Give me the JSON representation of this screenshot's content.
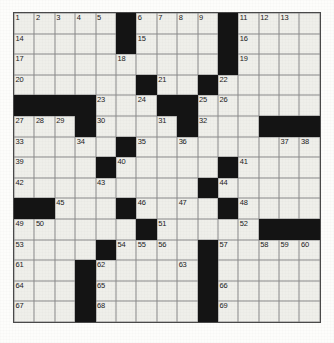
{
  "puzzle": {
    "type": "crossword-grid",
    "rows": 15,
    "cols": 15,
    "colors": {
      "block": "#141414",
      "open": "#efefea",
      "gridline": "#8a8a8a",
      "number": "#1a1a1a"
    },
    "blocks": [
      [
        0,
        5
      ],
      [
        0,
        10
      ],
      [
        1,
        5
      ],
      [
        1,
        10
      ],
      [
        2,
        10
      ],
      [
        3,
        6
      ],
      [
        3,
        9
      ],
      [
        4,
        0
      ],
      [
        4,
        1
      ],
      [
        4,
        2
      ],
      [
        4,
        3
      ],
      [
        4,
        7
      ],
      [
        4,
        8
      ],
      [
        5,
        3
      ],
      [
        5,
        8
      ],
      [
        5,
        12
      ],
      [
        5,
        13
      ],
      [
        5,
        14
      ],
      [
        6,
        5
      ],
      [
        7,
        4
      ],
      [
        7,
        10
      ],
      [
        8,
        9
      ],
      [
        9,
        0
      ],
      [
        9,
        1
      ],
      [
        9,
        5
      ],
      [
        9,
        10
      ],
      [
        10,
        6
      ],
      [
        10,
        12
      ],
      [
        10,
        13
      ],
      [
        10,
        14
      ],
      [
        11,
        4
      ],
      [
        11,
        9
      ],
      [
        12,
        3
      ],
      [
        12,
        9
      ],
      [
        13,
        3
      ],
      [
        13,
        9
      ],
      [
        14,
        3
      ],
      [
        14,
        9
      ]
    ],
    "numbers": [
      {
        "row": 0,
        "col": 0,
        "n": "1"
      },
      {
        "row": 0,
        "col": 1,
        "n": "2"
      },
      {
        "row": 0,
        "col": 2,
        "n": "3"
      },
      {
        "row": 0,
        "col": 3,
        "n": "4"
      },
      {
        "row": 0,
        "col": 4,
        "n": "5"
      },
      {
        "row": 0,
        "col": 6,
        "n": "6"
      },
      {
        "row": 0,
        "col": 7,
        "n": "7"
      },
      {
        "row": 0,
        "col": 8,
        "n": "8"
      },
      {
        "row": 0,
        "col": 9,
        "n": "9"
      },
      {
        "row": 0,
        "col": 10,
        "n": "10"
      },
      {
        "row": 0,
        "col": 11,
        "n": "11"
      },
      {
        "row": 0,
        "col": 12,
        "n": "12"
      },
      {
        "row": 0,
        "col": 13,
        "n": "13"
      },
      {
        "row": 1,
        "col": 0,
        "n": "14"
      },
      {
        "row": 1,
        "col": 6,
        "n": "15"
      },
      {
        "row": 1,
        "col": 11,
        "n": "16"
      },
      {
        "row": 2,
        "col": 0,
        "n": "17"
      },
      {
        "row": 2,
        "col": 5,
        "n": "18"
      },
      {
        "row": 2,
        "col": 11,
        "n": "19"
      },
      {
        "row": 3,
        "col": 0,
        "n": "20"
      },
      {
        "row": 3,
        "col": 7,
        "n": "21"
      },
      {
        "row": 3,
        "col": 10,
        "n": "22"
      },
      {
        "row": 4,
        "col": 4,
        "n": "23"
      },
      {
        "row": 4,
        "col": 6,
        "n": "24"
      },
      {
        "row": 4,
        "col": 9,
        "n": "25"
      },
      {
        "row": 4,
        "col": 10,
        "n": "26"
      },
      {
        "row": 5,
        "col": 0,
        "n": "27"
      },
      {
        "row": 5,
        "col": 1,
        "n": "28"
      },
      {
        "row": 5,
        "col": 2,
        "n": "29"
      },
      {
        "row": 5,
        "col": 4,
        "n": "30"
      },
      {
        "row": 5,
        "col": 7,
        "n": "31"
      },
      {
        "row": 5,
        "col": 9,
        "n": "32"
      },
      {
        "row": 6,
        "col": 0,
        "n": "33"
      },
      {
        "row": 6,
        "col": 3,
        "n": "34"
      },
      {
        "row": 6,
        "col": 6,
        "n": "35"
      },
      {
        "row": 6,
        "col": 8,
        "n": "36"
      },
      {
        "row": 6,
        "col": 13,
        "n": "37"
      },
      {
        "row": 6,
        "col": 14,
        "n": "38"
      },
      {
        "row": 7,
        "col": 0,
        "n": "39"
      },
      {
        "row": 7,
        "col": 5,
        "n": "40"
      },
      {
        "row": 7,
        "col": 11,
        "n": "41"
      },
      {
        "row": 8,
        "col": 0,
        "n": "42"
      },
      {
        "row": 8,
        "col": 4,
        "n": "43"
      },
      {
        "row": 8,
        "col": 10,
        "n": "44"
      },
      {
        "row": 9,
        "col": 2,
        "n": "45"
      },
      {
        "row": 9,
        "col": 6,
        "n": "46"
      },
      {
        "row": 9,
        "col": 8,
        "n": "47"
      },
      {
        "row": 9,
        "col": 11,
        "n": "48"
      },
      {
        "row": 10,
        "col": 0,
        "n": "49"
      },
      {
        "row": 10,
        "col": 1,
        "n": "50"
      },
      {
        "row": 10,
        "col": 7,
        "n": "51"
      },
      {
        "row": 10,
        "col": 11,
        "n": "52"
      },
      {
        "row": 11,
        "col": 0,
        "n": "53"
      },
      {
        "row": 11,
        "col": 5,
        "n": "54"
      },
      {
        "row": 11,
        "col": 6,
        "n": "55"
      },
      {
        "row": 11,
        "col": 7,
        "n": "56"
      },
      {
        "row": 11,
        "col": 10,
        "n": "57"
      },
      {
        "row": 11,
        "col": 12,
        "n": "58"
      },
      {
        "row": 11,
        "col": 13,
        "n": "59"
      },
      {
        "row": 11,
        "col": 14,
        "n": "60"
      },
      {
        "row": 12,
        "col": 0,
        "n": "61"
      },
      {
        "row": 12,
        "col": 4,
        "n": "62"
      },
      {
        "row": 12,
        "col": 8,
        "n": "63"
      },
      {
        "row": 13,
        "col": 0,
        "n": "64"
      },
      {
        "row": 13,
        "col": 4,
        "n": "65"
      },
      {
        "row": 13,
        "col": 10,
        "n": "66"
      },
      {
        "row": 14,
        "col": 0,
        "n": "67"
      },
      {
        "row": 14,
        "col": 4,
        "n": "68"
      },
      {
        "row": 14,
        "col": 10,
        "n": "69"
      }
    ]
  }
}
